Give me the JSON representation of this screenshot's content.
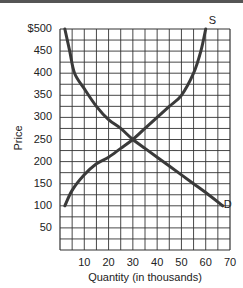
{
  "chart_data": {
    "type": "line",
    "title": "",
    "xlabel": "Quantity (in thousands)",
    "ylabel": "Price",
    "xlim": [
      0,
      70
    ],
    "ylim": [
      0,
      500
    ],
    "x_ticks": [
      "10",
      "20",
      "30",
      "40",
      "50",
      "60",
      "70"
    ],
    "y_ticks": [
      "$500",
      "450",
      "400",
      "350",
      "300",
      "250",
      "200",
      "150",
      "100",
      "50"
    ],
    "grid": true,
    "grid_x_step": 5,
    "grid_y_step": 25,
    "series": [
      {
        "name": "S",
        "label": "S",
        "points": [
          [
            2,
            100
          ],
          [
            5,
            135
          ],
          [
            10,
            170
          ],
          [
            15,
            195
          ],
          [
            20,
            210
          ],
          [
            25,
            230
          ],
          [
            30,
            250
          ],
          [
            35,
            275
          ],
          [
            40,
            300
          ],
          [
            45,
            325
          ],
          [
            50,
            350
          ],
          [
            55,
            400
          ],
          [
            58,
            450
          ],
          [
            60,
            500
          ]
        ]
      },
      {
        "name": "D",
        "label": "D",
        "points": [
          [
            2,
            500
          ],
          [
            4,
            450
          ],
          [
            6,
            400
          ],
          [
            10,
            365
          ],
          [
            15,
            325
          ],
          [
            20,
            295
          ],
          [
            25,
            275
          ],
          [
            30,
            250
          ],
          [
            35,
            230
          ],
          [
            40,
            210
          ],
          [
            45,
            190
          ],
          [
            50,
            170
          ],
          [
            55,
            150
          ],
          [
            60,
            130
          ],
          [
            67,
            100
          ]
        ]
      }
    ],
    "equilibrium": {
      "quantity": 30,
      "price": 250
    }
  },
  "colors": {
    "curve": "#3a3a3a",
    "grid": "#333333",
    "topbar": "#555555"
  }
}
